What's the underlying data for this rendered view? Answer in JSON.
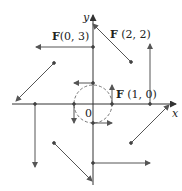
{
  "figure": {
    "type": "vector_field",
    "field": "F(x, y) = -y i + x j",
    "axes": {
      "x_label": "x",
      "y_label": "y",
      "origin_label": "0"
    },
    "labels": [
      {
        "text_bold": "F",
        "text_rest": "(0, 3)"
      },
      {
        "text_bold": "F",
        "text_rest": " (2, 2)"
      },
      {
        "text_bold": "F",
        "text_rest": " (1, 0)"
      }
    ],
    "vectors": [
      {
        "point": [
          0,
          3
        ],
        "vector": [
          -3,
          0
        ]
      },
      {
        "point": [
          2,
          2
        ],
        "vector": [
          -2,
          2
        ]
      },
      {
        "point": [
          3,
          0
        ],
        "vector": [
          0,
          3
        ]
      },
      {
        "point": [
          2,
          -2
        ],
        "vector": [
          2,
          2
        ]
      },
      {
        "point": [
          0,
          -3
        ],
        "vector": [
          3,
          0
        ]
      },
      {
        "point": [
          -2,
          -2
        ],
        "vector": [
          2,
          -2
        ]
      },
      {
        "point": [
          -3,
          0
        ],
        "vector": [
          0,
          -3
        ]
      },
      {
        "point": [
          -2,
          2
        ],
        "vector": [
          -2,
          -2
        ]
      },
      {
        "point": [
          1,
          0
        ],
        "vector": [
          0,
          1
        ]
      },
      {
        "point": [
          0,
          1
        ],
        "vector": [
          -1,
          0
        ]
      },
      {
        "point": [
          -1,
          0
        ],
        "vector": [
          0,
          -1
        ]
      },
      {
        "point": [
          0,
          -1
        ],
        "vector": [
          1,
          0
        ]
      }
    ],
    "circle_radius": 1,
    "colors": {
      "ink": "#333333",
      "vector": "#555555"
    }
  }
}
